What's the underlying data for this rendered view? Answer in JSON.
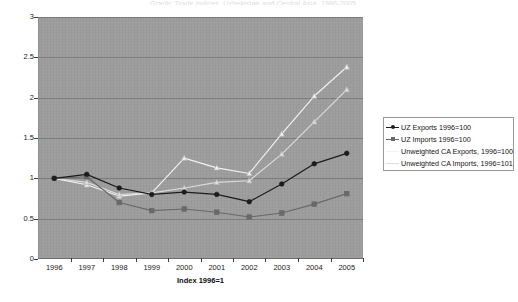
{
  "figure": {
    "title_sliver": "Graph: Trade indices, Uzbekistan and Central Asia, 1996-2005",
    "plot_bg": "#9d9d9d",
    "gridline_color": "#7c7c7c",
    "page_bg": "#ffffff"
  },
  "axes": {
    "y_ticks": [
      "3",
      "2.5",
      "2",
      "1.5",
      "1",
      "0.5",
      "0"
    ],
    "x_ticks": [
      "1996",
      "1997",
      "1998",
      "1999",
      "2000",
      "2001",
      "2002",
      "2003",
      "2004",
      "2005"
    ],
    "x_axis_title": "Index 1996=1"
  },
  "legend": {
    "items": [
      {
        "label": "UZ Exports 1996=100",
        "color": "#1c1c1c",
        "marker": "circle"
      },
      {
        "label": "UZ Imports 1996=100",
        "color": "#696969",
        "marker": "square"
      },
      {
        "label": "Unweighted CA Exports, 1996=100",
        "color": "#f2f2f2",
        "marker": "triangle"
      },
      {
        "label": "Unweighted CA Imports, 1996=101",
        "color": "#dcdcdc",
        "marker": "triangle"
      }
    ]
  },
  "chart_data": {
    "type": "line",
    "title": "",
    "xlabel": "Index 1996=1",
    "ylabel": "",
    "xlim": [
      1996,
      2005
    ],
    "ylim": [
      0,
      3
    ],
    "ytick_step": 0.5,
    "grid": true,
    "legend_position": "right",
    "categories": [
      1996,
      1997,
      1998,
      1999,
      2000,
      2001,
      2002,
      2003,
      2004,
      2005
    ],
    "series": [
      {
        "name": "UZ Exports 1996=100",
        "color": "#1c1c1c",
        "marker": "circle",
        "values": [
          1.0,
          1.05,
          0.88,
          0.8,
          0.83,
          0.8,
          0.71,
          0.93,
          1.18,
          1.31
        ]
      },
      {
        "name": "UZ Imports 1996=100",
        "color": "#696969",
        "marker": "square",
        "values": [
          1.0,
          1.02,
          0.7,
          0.6,
          0.62,
          0.58,
          0.52,
          0.57,
          0.68,
          0.81
        ]
      },
      {
        "name": "Unweighted CA Exports, 1996=100",
        "color": "#f2f2f2",
        "marker": "triangle",
        "values": [
          1.0,
          0.92,
          0.78,
          0.82,
          1.25,
          1.13,
          1.06,
          1.55,
          2.02,
          2.38
        ]
      },
      {
        "name": "Unweighted CA Imports, 1996=101",
        "color": "#dcdcdc",
        "marker": "triangle",
        "values": [
          1.0,
          0.95,
          0.8,
          0.82,
          0.88,
          0.95,
          0.97,
          1.3,
          1.7,
          2.1
        ]
      }
    ]
  }
}
